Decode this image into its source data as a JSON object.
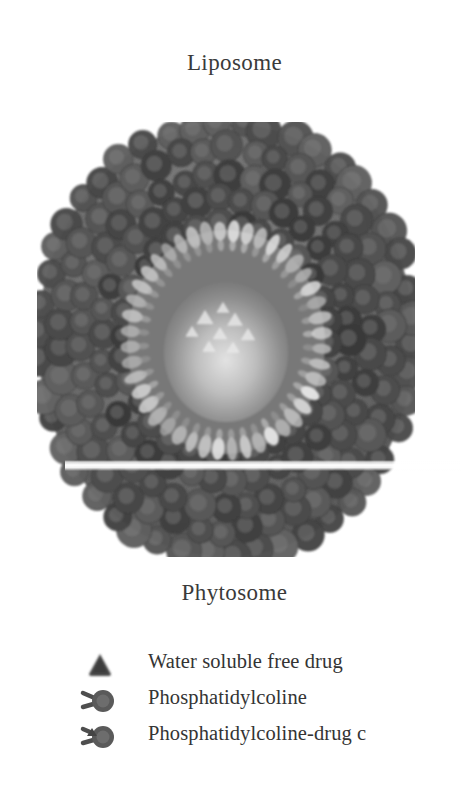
{
  "figure": {
    "kind": "scientific-diagram",
    "top_label": "Liposome",
    "bottom_label": "Phytosome",
    "colors": {
      "outer_shell": "#6e6e6e",
      "outer_shell_dark": "#4f4f4f",
      "inner_ring_light": "#c9c9c9",
      "core": "#8a8a8a",
      "core_glow": "#d9d9d9",
      "background": "#ffffff",
      "text": "#343434",
      "scanline": "#ffffff"
    },
    "geometry": {
      "center_x": 226,
      "center_y": 340,
      "outer_radius_x": 189,
      "outer_radius_y": 218,
      "inner_ring_radius_x": 96,
      "inner_ring_radius_y": 110,
      "core_radius_x": 60,
      "core_radius_y": 68,
      "scanline_y": 344
    }
  },
  "legend": {
    "items": [
      {
        "marker": "triangle-icon",
        "marker_name": "free-drug-triangle-icon",
        "label": "Water soluble free drug"
      },
      {
        "marker": "phospholipid-icon",
        "marker_name": "phosphatidylcoline-icon",
        "label": "Phosphatidylcoline"
      },
      {
        "marker": "phospholipid-drug-icon",
        "marker_name": "phosphatidylcoline-drug-complex-icon",
        "label": "Phosphatidylcoline-drug c"
      }
    ]
  }
}
